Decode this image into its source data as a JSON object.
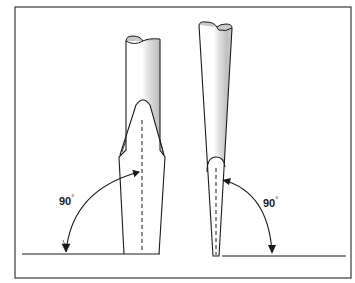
{
  "figure": {
    "views": [
      {
        "name": "front-view",
        "angle_label": "90",
        "angle_unit": "°"
      },
      {
        "name": "side-view",
        "angle_label": "90",
        "angle_unit": "°"
      }
    ],
    "colors": {
      "line": "#1a1a1a",
      "shade": "#bdbdbd",
      "background": "#ffffff"
    }
  }
}
